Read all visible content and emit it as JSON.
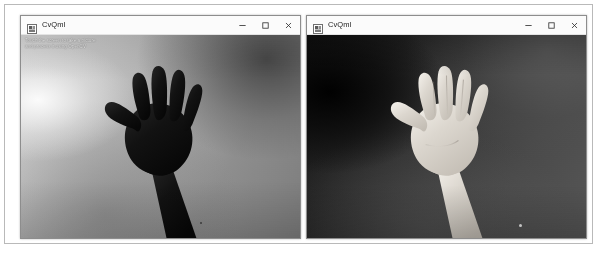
{
  "page": {
    "background_color": "#ffffff",
    "frame_border_color": "#b9b9b9"
  },
  "windows": [
    {
      "id": "left",
      "title": "CvQml",
      "icon": "app-icon",
      "controls": {
        "minimize_label": "Minimize",
        "maximize_label": "Maximize",
        "close_label": "Close"
      },
      "viewport": {
        "name": "camera-preview",
        "mode": "original",
        "overlay_lines": [
          "Touch the screen to take a picture",
          "and process it using OpenCV"
        ],
        "subject": "open hand, palm toward camera, five fingers spread",
        "hand_tone": "#141414",
        "background_tone": "#b0b0b0"
      }
    },
    {
      "id": "right",
      "title": "CvQml",
      "icon": "app-icon",
      "controls": {
        "minimize_label": "Minimize",
        "maximize_label": "Maximize",
        "close_label": "Close"
      },
      "viewport": {
        "name": "camera-preview",
        "mode": "inverted",
        "overlay_lines": [],
        "subject": "open hand, palm toward camera, five fingers spread",
        "hand_tone": "#e8e4dd",
        "background_tone": "#2b2b2b"
      }
    }
  ]
}
